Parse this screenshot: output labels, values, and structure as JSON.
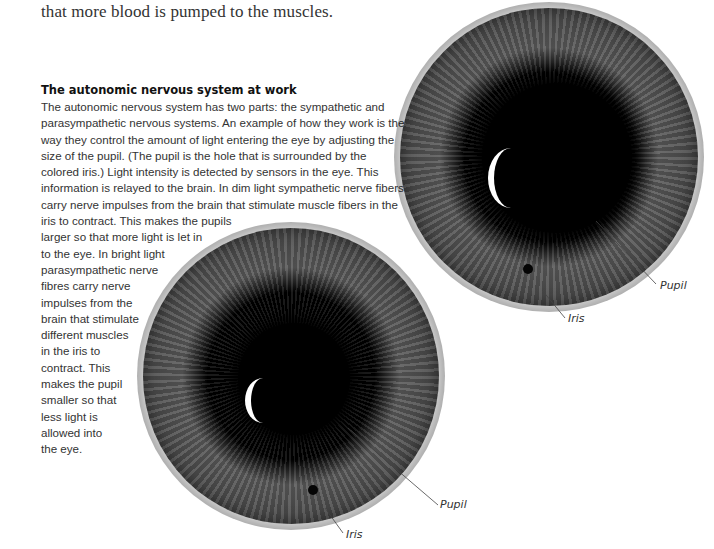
{
  "lead_text": "that more blood is pumped to the muscles.",
  "section": {
    "heading": "The autonomic nervous system at work",
    "lines": [
      "The autonomic nervous system has two parts: the sympathetic and",
      "parasympathetic nervous systems. An example of how they work is the",
      "way they control the amount of light entering the eye by adjusting the",
      "size of the pupil. (The pupil is the hole that is surrounded by the",
      "colored iris.) Light intensity is detected by sensors in the eye. This",
      "information is relayed to the brain. In dim light sympathetic nerve fibers",
      "carry nerve impulses from the brain that stimulate muscle fibers in the",
      "iris to contract. This makes the pupils",
      "larger so that more light is let in",
      "to the eye. In bright light",
      "parasympathetic nerve",
      "fibres carry nerve",
      "impulses from the",
      "brain that stimulate",
      "different muscles",
      "in the iris to",
      "contract. This",
      "makes the pupil",
      "smaller so that",
      "less light is",
      "allowed into",
      "the eye."
    ]
  },
  "figures": {
    "dilated_eye": {
      "pupil_label": "Pupil",
      "iris_label": "Iris"
    },
    "constricted_eye": {
      "pupil_label": "Pupil",
      "iris_label": "Iris"
    }
  }
}
